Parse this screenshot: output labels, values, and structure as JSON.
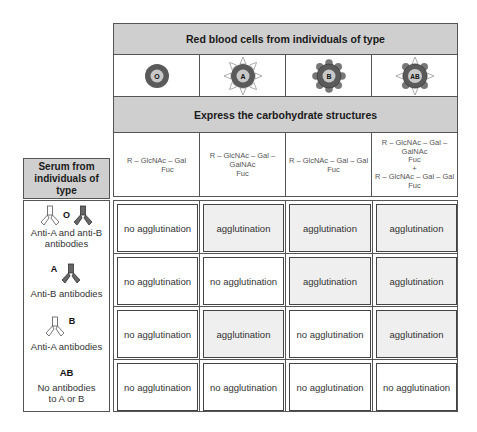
{
  "header": {
    "title": "Red blood cells from individuals of type",
    "carbohydrate_title": "Express the carbohydrate structures"
  },
  "blood_types": [
    {
      "label": "O",
      "antigens": "none"
    },
    {
      "label": "A",
      "antigens": "A"
    },
    {
      "label": "B",
      "antigens": "B"
    },
    {
      "label": "AB",
      "antigens": "A+B"
    }
  ],
  "carbohydrates": [
    {
      "lines": [
        "R – GlcNAc – Gal",
        "Fuc"
      ]
    },
    {
      "lines": [
        "R – GlcNAc – Gal – GalNAc",
        "Fuc"
      ]
    },
    {
      "lines": [
        "R – GlcNAc – Gal – Gal",
        "Fuc"
      ]
    },
    {
      "lines": [
        "R – GlcNAc – Gal – GalNAc",
        "Fuc",
        "+",
        "R – GlcNAc – Gal – Gal",
        "Fuc"
      ]
    }
  ],
  "serum_header": "Serum from individuals of type",
  "serum_rows": [
    {
      "type": "O",
      "description": "Anti-A and anti-B antibodies",
      "antibodies": [
        "anti-A",
        "anti-B"
      ],
      "results": [
        "no agglutination",
        "agglutination",
        "agglutination",
        "agglutination"
      ]
    },
    {
      "type": "A",
      "description": "Anti-B antibodies",
      "antibodies": [
        "anti-B"
      ],
      "results": [
        "no agglutination",
        "no agglutination",
        "agglutination",
        "agglutination"
      ]
    },
    {
      "type": "B",
      "description": "Anti-A antibodies",
      "antibodies": [
        "anti-A"
      ],
      "results": [
        "no agglutination",
        "agglutination",
        "no agglutination",
        "agglutination"
      ]
    },
    {
      "type": "AB",
      "description": "No antibodies to A or B",
      "antibodies": [],
      "results": [
        "no agglutination",
        "no agglutination",
        "no agglutination",
        "no agglutination"
      ]
    }
  ],
  "colors": {
    "header_gray": "#cfcfcf",
    "cell_outer": "#5a5a5a",
    "cell_inner": "#c8c8c8",
    "antigen_A_fill": "#ffffff",
    "antigen_B_fill": "#707070",
    "agglutination_bg": "#efefef"
  }
}
